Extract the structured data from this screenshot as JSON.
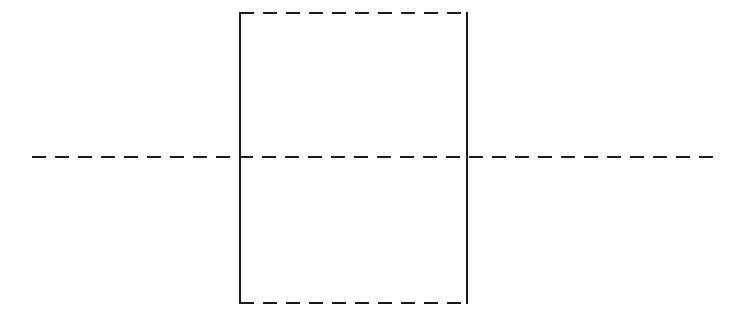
{
  "figure": {
    "canvas": {
      "width": 756,
      "height": 324,
      "background_color": "#ffffff"
    },
    "style": {
      "stroke_color": "#1a1a1a",
      "stroke_width": 2,
      "dash_length": 14,
      "gap_length": 9,
      "dash_array": "14 9",
      "line_cap": "butt"
    },
    "shapes": {
      "rectangle": {
        "name": "dashed-rectangle",
        "x": 240,
        "y": 13,
        "width": 227,
        "height": 290,
        "left_edge_style": "solid",
        "right_edge_style": "solid",
        "top_edge_style": "dashed",
        "bottom_edge_style": "dashed",
        "fill": "none"
      },
      "centerline": {
        "name": "horizontal-center-axis",
        "x_start": 32,
        "x_end": 722,
        "y": 157,
        "style": "dashed",
        "length": 690
      }
    },
    "edges": {
      "top": {
        "label": "top-edge",
        "x1": 240,
        "y1": 13,
        "x2": 467,
        "y2": 13,
        "style": "dashed"
      },
      "bottom": {
        "label": "bottom-edge",
        "x1": 240,
        "y1": 303,
        "x2": 467,
        "y2": 303,
        "style": "dashed"
      },
      "left": {
        "label": "left-edge",
        "x1": 240,
        "y1": 13,
        "x2": 240,
        "y2": 303,
        "style": "solid"
      },
      "right": {
        "label": "right-edge",
        "x1": 467,
        "y1": 13,
        "x2": 467,
        "y2": 303,
        "style": "solid"
      }
    }
  }
}
